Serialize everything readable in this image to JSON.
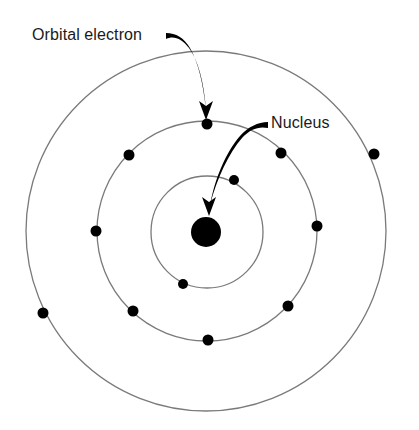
{
  "diagram": {
    "background_color": "#ffffff",
    "orbit_color": "#7a7a7a",
    "electron_color": "#000000",
    "nucleus_color": "#000000",
    "arrow_color": "#000000",
    "label_color": "#1a1a1a",
    "center": {
      "x": 206,
      "y": 231
    }
  },
  "labels": {
    "orbital_electron": "Orbital electron",
    "nucleus": "Nucleus"
  },
  "nucleus": {
    "cx": 206,
    "cy": 232,
    "r": 15
  },
  "orbits": [
    {
      "name": "inner-orbit",
      "cx": 207,
      "cy": 232,
      "r": 56,
      "electron_count": 2
    },
    {
      "name": "middle-orbit",
      "cx": 207,
      "cy": 231,
      "r": 110,
      "electron_count": 6
    },
    {
      "name": "outer-orbit",
      "cx": 206,
      "cy": 231,
      "r": 180,
      "electron_count": 4
    }
  ],
  "electrons": [
    {
      "id": "e-inner-1",
      "orbit": "inner-orbit",
      "cx": 234,
      "cy": 180,
      "r": 5
    },
    {
      "id": "e-inner-2",
      "orbit": "inner-orbit",
      "cx": 183,
      "cy": 284,
      "r": 5
    },
    {
      "id": "e-mid-1",
      "orbit": "middle-orbit",
      "cx": 207,
      "cy": 124,
      "r": 5.5
    },
    {
      "id": "e-mid-2",
      "orbit": "middle-orbit",
      "cx": 281,
      "cy": 153,
      "r": 5.5
    },
    {
      "id": "e-mid-3",
      "orbit": "middle-orbit",
      "cx": 288,
      "cy": 306,
      "r": 5.5
    },
    {
      "id": "e-mid-4",
      "orbit": "middle-orbit",
      "cx": 208,
      "cy": 340,
      "r": 5.5
    },
    {
      "id": "e-mid-5",
      "orbit": "middle-orbit",
      "cx": 133,
      "cy": 311,
      "r": 5.5
    },
    {
      "id": "e-mid-6",
      "orbit": "middle-orbit",
      "cx": 129,
      "cy": 155,
      "r": 5.5
    },
    {
      "id": "e-outer-1",
      "orbit": "outer-orbit",
      "cx": 374,
      "cy": 154,
      "r": 5.5
    },
    {
      "id": "e-outer-2",
      "orbit": "outer-orbit",
      "cx": 317,
      "cy": 226,
      "r": 5.5
    },
    {
      "id": "e-outer-3",
      "orbit": "outer-orbit",
      "cx": 96,
      "cy": 231,
      "r": 5.5
    },
    {
      "id": "e-outer-4",
      "orbit": "outer-orbit",
      "cx": 43,
      "cy": 313,
      "r": 5.5
    }
  ],
  "annotations": {
    "orbital_electron_label_position": {
      "x": 32,
      "y": 40
    },
    "nucleus_label_position": {
      "x": 268,
      "y": 128
    },
    "orbital_electron_arrow_target": {
      "x": 207,
      "y": 118
    },
    "nucleus_arrow_target": {
      "x": 210,
      "y": 210
    }
  }
}
